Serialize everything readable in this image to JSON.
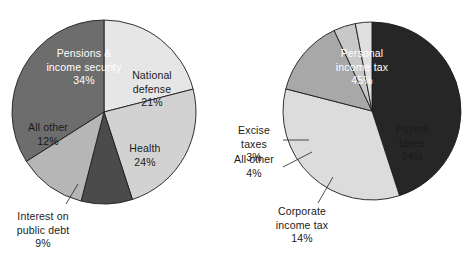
{
  "figure": {
    "background": "#ffffff",
    "width": 467,
    "height": 258
  },
  "chart_data": [
    {
      "type": "pie",
      "id": "federal-spending",
      "title": "",
      "position": "left",
      "center": [
        104,
        112
      ],
      "radius": 92,
      "start_angle_deg": 0,
      "direction": "clockwise",
      "legend": "none",
      "labels_inside": true,
      "categories": [
        "National defense",
        "Health",
        "Interest on public debt",
        "All other",
        "Pensions & income security"
      ],
      "values": [
        21,
        24,
        9,
        12,
        34
      ],
      "value_labels": [
        "21%",
        "24%",
        "9%",
        "12%",
        "34%"
      ],
      "colors": [
        "#e6e6e6",
        "#d2d2d2",
        "#4b4b4b",
        "#b6b6b6",
        "#6d6d6d"
      ],
      "slices": [
        {
          "name": "National defense",
          "label_lines": [
            "National",
            "defense",
            "21%"
          ],
          "value": 21,
          "value_label": "21%",
          "color": "#e6e6e6",
          "text_color": "#1a1a1a",
          "callout": false,
          "label_pos": [
            152,
            79
          ]
        },
        {
          "name": "Health",
          "label_lines": [
            "Health",
            "24%"
          ],
          "value": 24,
          "value_label": "24%",
          "color": "#d2d2d2",
          "text_color": "#1a1a1a",
          "callout": false,
          "label_pos": [
            145,
            152
          ]
        },
        {
          "name": "Interest on public debt",
          "label_lines": [
            "Interest on",
            "public debt",
            "9%"
          ],
          "value": 9,
          "value_label": "9%",
          "color": "#4b4b4b",
          "text_color": "#1a1a1a",
          "callout": true,
          "label_pos": [
            43,
            220
          ],
          "leader": [
            [
              78,
              184
            ],
            [
              66,
              204
            ]
          ]
        },
        {
          "name": "All other",
          "label_lines": [
            "All other",
            "12%"
          ],
          "value": 12,
          "value_label": "12%",
          "color": "#b6b6b6",
          "text_color": "#1a1a1a",
          "callout": false,
          "label_pos": [
            48,
            131
          ]
        },
        {
          "name": "Pensions & income security",
          "label_lines": [
            "Pensions &",
            "income security",
            "34%"
          ],
          "value": 34,
          "value_label": "34%",
          "color": "#6d6d6d",
          "text_color": "#ffffff",
          "callout": false,
          "label_pos": [
            84,
            57
          ]
        }
      ]
    },
    {
      "type": "pie",
      "id": "federal-revenue",
      "title": "",
      "position": "right",
      "center": [
        372,
        111
      ],
      "radius": 89,
      "start_angle_deg": 0,
      "direction": "clockwise",
      "legend": "none",
      "labels_inside": false,
      "categories": [
        "Personal income tax",
        "Payroll taxes",
        "Corporate income tax",
        "All other",
        "Excise taxes"
      ],
      "values": [
        45,
        34,
        14,
        4,
        3
      ],
      "value_labels": [
        "45%",
        "34%",
        "14%",
        "4%",
        "3%"
      ],
      "colors": [
        "#262626",
        "#dcdcdc",
        "#a8a8a8",
        "#c8c8c8",
        "#e0e0e0"
      ],
      "slices": [
        {
          "name": "Personal income tax",
          "label_lines": [
            "Personal",
            "income tax",
            "45%"
          ],
          "value": 45,
          "value_label": "45%",
          "color": "#262626",
          "text_color": "#ffffff",
          "callout": false,
          "label_pos": [
            362,
            57
          ]
        },
        {
          "name": "Payroll taxes",
          "label_lines": [
            "Payroll",
            "taxes",
            "34%"
          ],
          "value": 34,
          "value_label": "34%",
          "color": "#dcdcdc",
          "text_color": "#1a1a1a",
          "callout": false,
          "label_pos": [
            412,
            133
          ]
        },
        {
          "name": "Corporate income tax",
          "label_lines": [
            "Corporate",
            "income tax",
            "14%"
          ],
          "value": 14,
          "value_label": "14%",
          "color": "#a8a8a8",
          "text_color": "#1a1a1a",
          "callout": true,
          "label_pos": [
            302,
            215
          ],
          "leader": [
            [
              333,
              177
            ],
            [
              318,
              203
            ]
          ]
        },
        {
          "name": "All other",
          "label_lines": [
            "All other",
            "4%"
          ],
          "value": 4,
          "value_label": "4%",
          "color": "#c8c8c8",
          "text_color": "#1a1a1a",
          "callout": true,
          "label_pos": [
            254,
            163
          ],
          "leader": [
            [
              312,
              152
            ],
            [
              283,
              167
            ]
          ]
        },
        {
          "name": "Excise taxes",
          "label_lines": [
            "Excise",
            "taxes",
            "3%"
          ],
          "value": 3,
          "value_label": "3%",
          "color": "#e0e0e0",
          "text_color": "#1a1a1a",
          "callout": true,
          "label_pos": [
            254,
            134
          ],
          "leader": [
            [
              309,
              140
            ],
            [
              283,
              140
            ]
          ]
        }
      ]
    }
  ]
}
